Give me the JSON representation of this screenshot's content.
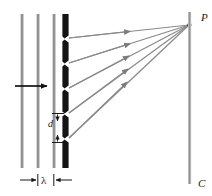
{
  "figure": {
    "width": 212,
    "height": 196,
    "background": "#ffffff"
  },
  "labels": {
    "point_P": "P",
    "screen_C": "C",
    "slit_spacing_d": "d",
    "wavelength_lambda": "λ"
  },
  "colors": {
    "wavefront": "#8c8c8c",
    "barrier": "#141414",
    "ray": "#8a8a8a",
    "screen": "#a8a8a8",
    "arrow": "#111111",
    "label": "#1a1a1a"
  },
  "elements": {
    "wavefronts": {
      "name": "incident-plane-wavefronts",
      "count": 3,
      "x_positions": [
        22,
        38,
        54
      ],
      "y_top": 14,
      "y_bottom": 168,
      "thickness": 3
    },
    "propagation_arrow": {
      "name": "wave-direction-arrow",
      "x_start": 15,
      "x_end": 48,
      "y": 86
    },
    "grating": {
      "name": "diffraction-grating-barrier",
      "x": 65,
      "segments": 6,
      "slits": 5,
      "segment_tops": [
        14,
        44,
        69,
        94,
        119,
        144
      ],
      "segment_height": 24,
      "thickness": 6
    },
    "rays": {
      "name": "diffracted-rays",
      "count": 5,
      "origin_y": [
        38,
        63,
        88,
        113,
        138
      ],
      "target": {
        "x": 190,
        "y": 25
      },
      "arrowhead_positions": [
        {
          "x": 131,
          "y": 31
        },
        {
          "x": 131,
          "y": 44
        },
        {
          "x": 130,
          "y": 57
        },
        {
          "x": 129,
          "y": 71
        },
        {
          "x": 128,
          "y": 84
        }
      ]
    },
    "screen": {
      "name": "observation-screen",
      "x": 190,
      "y_top": 12,
      "y_bottom": 184,
      "thickness": 3
    },
    "d_dimension": {
      "name": "slit-spacing-dimension",
      "x": 58,
      "y_top": 113,
      "y_bottom": 143
    },
    "lambda_dimension": {
      "name": "wavelength-dimension",
      "y": 180,
      "x_left_tick": 38,
      "x_right_tick": 54,
      "x_outer_left": 20,
      "x_outer_right": 72
    }
  }
}
